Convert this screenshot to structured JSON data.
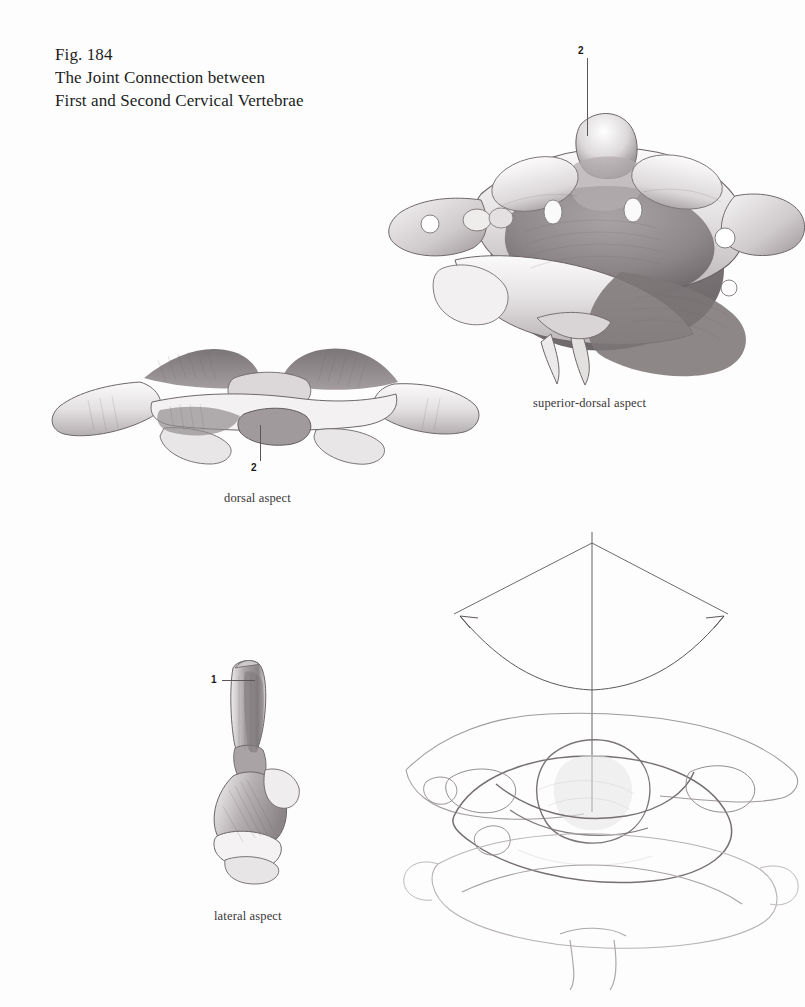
{
  "page": {
    "background_color": "#fdfdfd",
    "ink_color": "#231f20",
    "width": 805,
    "height": 1007
  },
  "title": {
    "figure_number": "Fig. 184",
    "line_1": "The Joint Connection between",
    "line_2": "First and Second Cervical Vertebrae"
  },
  "figures": [
    {
      "id": "superior-dorsal",
      "caption": "superior-dorsal aspect",
      "medium": "pencil-rendered anatomical drawing",
      "subject": "atlas and axis vertebrae viewed from above and behind"
    },
    {
      "id": "dorsal",
      "caption": "dorsal aspect",
      "medium": "pencil-rendered anatomical drawing",
      "subject": "atlas and axis vertebrae viewed from behind"
    },
    {
      "id": "lateral",
      "caption": "lateral aspect",
      "medium": "pencil-rendered anatomical drawing",
      "subject": "axis vertebra with dens viewed from the side"
    },
    {
      "id": "rotation",
      "caption": "",
      "medium": "light line drawing with rotation-axis diagram",
      "subject": "atlas rotating upon the axis around the vertical dens axis"
    }
  ],
  "labels": [
    {
      "number": "2",
      "figure": "superior-dorsal",
      "leader": "vertical-down"
    },
    {
      "number": "2",
      "figure": "dorsal",
      "leader": "vertical-up"
    },
    {
      "number": "1",
      "figure": "lateral",
      "leader": "horizontal-right"
    }
  ],
  "captions": {
    "superior_dorsal": "superior-dorsal aspect",
    "dorsal": "dorsal aspect",
    "lateral": "lateral aspect"
  },
  "rotation_diagram": {
    "axis_label": "",
    "arrow_type": "double-headed curved arc",
    "description": "vertical rotation axis through the dens with a curved double arrow indicating the range of axial rotation"
  }
}
